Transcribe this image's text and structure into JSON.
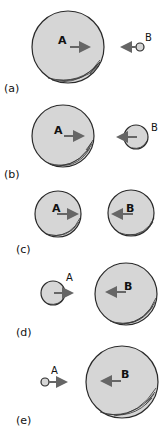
{
  "figure": {
    "panels": [
      {
        "id": "a",
        "label": "(a)",
        "ballA": {
          "label": "A",
          "cx": 68,
          "cy": 47,
          "r": 36,
          "direction": "right"
        },
        "ballB": {
          "label": "B",
          "cx": 140,
          "cy": 47,
          "r": 4,
          "direction": "left"
        }
      },
      {
        "id": "b",
        "label": "(b)",
        "ballA": {
          "label": "A",
          "cx": 63,
          "cy": 136,
          "r": 31,
          "direction": "right"
        },
        "ballB": {
          "label": "B",
          "cx": 136,
          "cy": 137,
          "r": 12,
          "direction": "left"
        }
      },
      {
        "id": "c",
        "label": "(c)",
        "ballA": {
          "label": "A",
          "cx": 58,
          "cy": 214,
          "r": 23,
          "direction": "right"
        },
        "ballB": {
          "label": "B",
          "cx": 131,
          "cy": 213,
          "r": 23,
          "direction": "left"
        }
      },
      {
        "id": "d",
        "label": "(d)",
        "ballA": {
          "label": "A",
          "cx": 53,
          "cy": 293,
          "r": 12,
          "direction": "right"
        },
        "ballB": {
          "label": "B",
          "cx": 126,
          "cy": 294,
          "r": 31,
          "direction": "left"
        }
      },
      {
        "id": "e",
        "label": "(e)",
        "ballA": {
          "label": "A",
          "cx": 45,
          "cy": 382,
          "r": 4,
          "direction": "right"
        },
        "ballB": {
          "label": "B",
          "cx": 122,
          "cy": 382,
          "r": 36,
          "direction": "left"
        }
      }
    ]
  },
  "colors": {
    "ball_fill": "#d6d6d6",
    "outline": "#2a2a2a",
    "arrow": "#666666"
  }
}
